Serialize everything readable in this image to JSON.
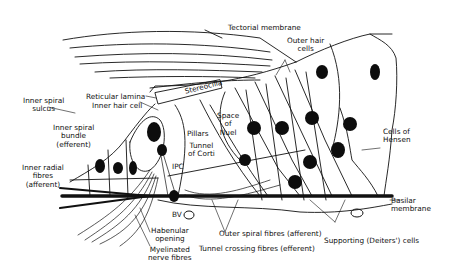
{
  "diagram": {
    "colors": {
      "ink": "#111111",
      "background": "#ffffff",
      "nucleus": "#0d0d0d"
    },
    "labels": {
      "tectorial_membrane": "Tectorial membrane",
      "outer_hair_cells": [
        "Outer hair",
        "cells"
      ],
      "reticular_lamina": "Reticular lamina",
      "inner_hair_cell": "Inner hair cell",
      "stereocilia": "Stereocilia",
      "inner_spiral_sulcus": [
        "Inner spiral",
        "sulcus"
      ],
      "inner_spiral_bundle": [
        "Inner spiral",
        "bundle",
        "(efferent)"
      ],
      "space_of_nuel": [
        "Space",
        "of",
        "Nuel"
      ],
      "pillars": "Pillars",
      "tunnel_of_corti": [
        "Tunnel",
        "of Corti"
      ],
      "ipc": "IPC",
      "cells_of_hensen": [
        "Cells of",
        "Hensen"
      ],
      "inner_radial_fibres": [
        "Inner radial",
        "fibres",
        "(afferent)"
      ],
      "basilar_membrane": [
        "Basilar",
        "membrane"
      ],
      "bv": "BV",
      "habenular_opening": [
        "Habenular",
        "opening"
      ],
      "myelinated_nerve_fibres": [
        "Myelinated",
        "nerve fibres"
      ],
      "outer_spiral_fibres": "Outer spiral fibres (afferent)",
      "tunnel_crossing_fibres": "Tunnel crossing fibres (efferent)",
      "supporting_cells": "Supporting (Deiters') cells"
    }
  }
}
